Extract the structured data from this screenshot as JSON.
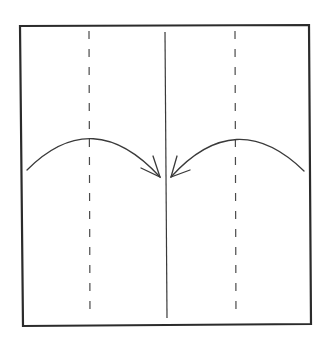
{
  "diagram": {
    "type": "origami-fold-instruction",
    "description": "Fold both side edges to the center line",
    "colors": {
      "background": "#ffffff",
      "outline": "#2b2b2b",
      "line": "#3a3a3a",
      "fold_line": "#4a4a4a"
    },
    "paper": {
      "shape": "square",
      "points": "20,26 309,25 311,324 23,326"
    },
    "lines": [
      {
        "name": "left-valley-fold",
        "style": "dashed",
        "x1": 89,
        "y1": 31,
        "x2": 90,
        "y2": 318
      },
      {
        "name": "center-crease",
        "style": "solid",
        "x1": 165,
        "y1": 32,
        "x2": 167,
        "y2": 318
      },
      {
        "name": "right-valley-fold",
        "style": "dashed",
        "x1": 235,
        "y1": 31,
        "x2": 236,
        "y2": 318
      }
    ],
    "arrows": [
      {
        "name": "left-fold-arrow",
        "direction": "left-edge-to-center",
        "path": "M 27 170 Q 93 104 160 177",
        "head": "M 153 156 L 160 177 L 141 168"
      },
      {
        "name": "right-fold-arrow",
        "direction": "right-edge-to-center",
        "path": "M 304 171 Q 236 105 171 177",
        "head": "M 177 156 L 171 177 L 190 170"
      }
    ]
  }
}
